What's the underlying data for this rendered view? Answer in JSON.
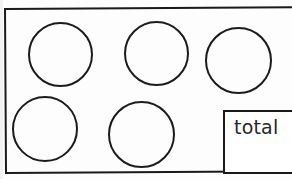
{
  "worksheet": {
    "title": "counting circles worksheet",
    "background_color": "#fdfdfd",
    "ink_color": "#1a1a1a",
    "frame": {
      "name": "outer-border",
      "x": 4,
      "y": 8,
      "width": 300,
      "height": 166,
      "stroke_width": 2,
      "clipped_right": true
    },
    "circles": [
      {
        "id": "circle-1",
        "row": 1,
        "col": 1,
        "x": 28,
        "y": 22,
        "diameter": 65
      },
      {
        "id": "circle-2",
        "row": 1,
        "col": 2,
        "x": 124,
        "y": 21,
        "diameter": 65
      },
      {
        "id": "circle-3",
        "row": 1,
        "col": 3,
        "x": 205,
        "y": 27,
        "diameter": 67
      },
      {
        "id": "circle-4",
        "row": 2,
        "col": 1,
        "x": 12,
        "y": 96,
        "diameter": 66
      },
      {
        "id": "circle-5",
        "row": 2,
        "col": 2,
        "x": 108,
        "y": 101,
        "diameter": 67
      }
    ],
    "circle_count": 5,
    "total_box": {
      "label": "total",
      "x": 223,
      "y": 110,
      "width": 86,
      "height": 64,
      "value": "",
      "clipped_right": true
    }
  }
}
